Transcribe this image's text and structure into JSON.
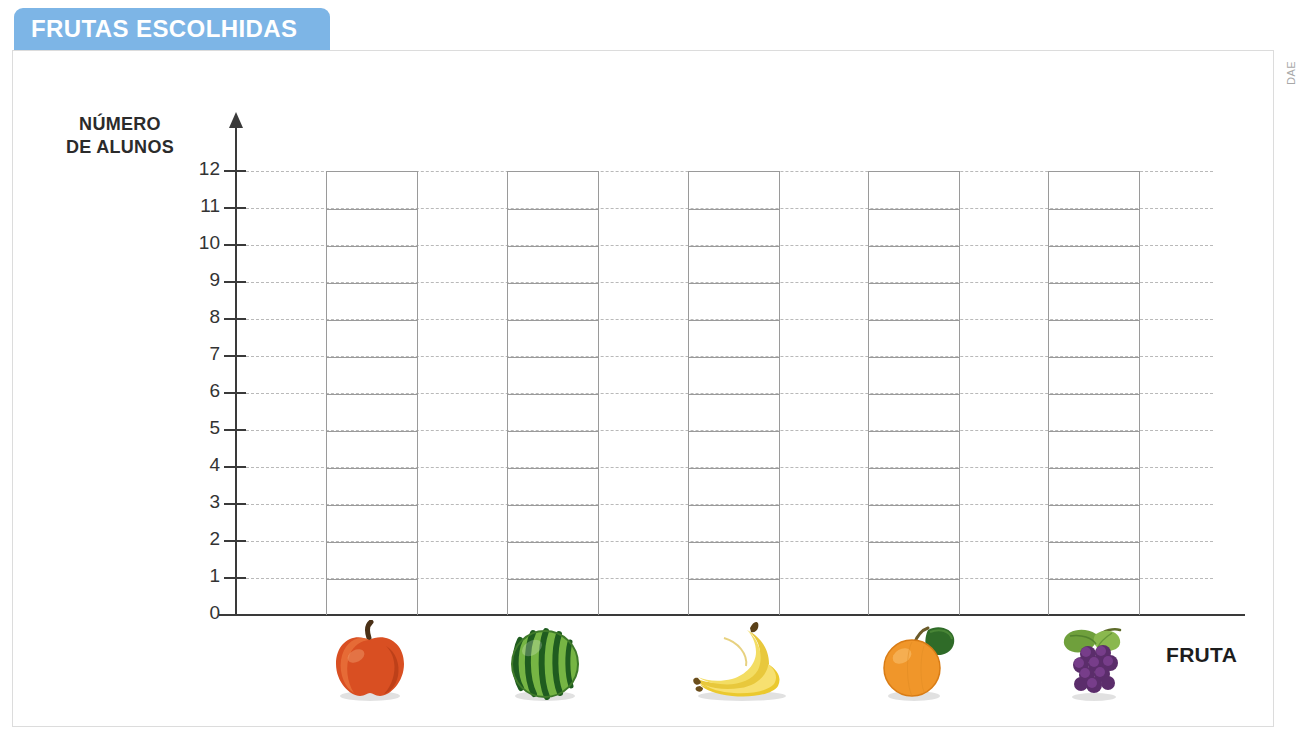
{
  "banner": {
    "title": "FRUTAS ESCOLHIDAS",
    "color": "#7db5e6",
    "text_color": "#ffffff"
  },
  "credit": {
    "label": "DAE"
  },
  "axes": {
    "y_title_line1": "NÚMERO",
    "y_title_line2": "DE ALUNOS",
    "x_title": "FRUTA"
  },
  "chart_data": {
    "type": "bar",
    "title": "FRUTAS ESCOLHIDAS",
    "xlabel": "FRUTA",
    "ylabel": "NÚMERO DE ALUNOS",
    "categories": [
      "maçã",
      "melancia",
      "banana",
      "laranja",
      "uva"
    ],
    "category_icons": [
      "apple-icon",
      "watermelon-icon",
      "banana-icon",
      "orange-icon",
      "grapes-icon"
    ],
    "values": [
      null,
      null,
      null,
      null,
      null
    ],
    "ylim": [
      0,
      12
    ],
    "ytick_labels": [
      "0",
      "1",
      "2",
      "3",
      "4",
      "5",
      "6",
      "7",
      "8",
      "9",
      "10",
      "11",
      "12"
    ],
    "ytick_values": [
      0,
      1,
      2,
      3,
      4,
      5,
      6,
      7,
      8,
      9,
      10,
      11,
      12
    ],
    "grid": true,
    "grid_style": "dashed",
    "legend": "none",
    "note": "Blank worksheet grid: empty bar columns divided into 12 unit cells, no data filled in."
  },
  "colors": {
    "axis": "#3a3a3a",
    "gridline": "#b9b9b9",
    "column_outline": "#9a9a9a",
    "frame": "#dcdcdc"
  }
}
